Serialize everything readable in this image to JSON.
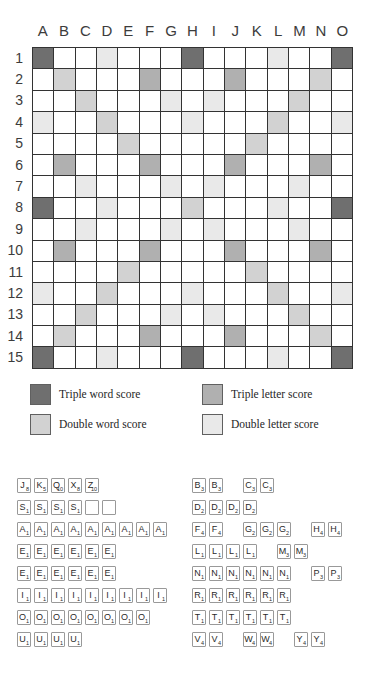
{
  "board": {
    "columns": [
      "A",
      "B",
      "C",
      "D",
      "E",
      "F",
      "G",
      "H",
      "I",
      "J",
      "K",
      "L",
      "M",
      "N",
      "O"
    ],
    "rows": [
      "1",
      "2",
      "3",
      "4",
      "5",
      "6",
      "7",
      "8",
      "9",
      "10",
      "11",
      "12",
      "13",
      "14",
      "15"
    ],
    "premium_squares": {
      "triple_word": [
        "A1",
        "H1",
        "O1",
        "A8",
        "O8",
        "A15",
        "H15",
        "O15"
      ],
      "double_word": [
        "B2",
        "N2",
        "C3",
        "M3",
        "D4",
        "L4",
        "E5",
        "K5",
        "H8",
        "E11",
        "K11",
        "D12",
        "L12",
        "C13",
        "M13",
        "B14",
        "N14"
      ],
      "triple_letter": [
        "F2",
        "J2",
        "B6",
        "F6",
        "J6",
        "N6",
        "B10",
        "F10",
        "J10",
        "N10",
        "F14",
        "J14"
      ],
      "double_letter": [
        "D1",
        "L1",
        "G3",
        "I3",
        "A4",
        "H4",
        "O4",
        "C7",
        "G7",
        "I7",
        "M7",
        "D8",
        "L8",
        "C9",
        "G9",
        "I9",
        "M9",
        "A12",
        "H12",
        "O12",
        "G13",
        "I13",
        "D15",
        "L15"
      ]
    }
  },
  "colors": {
    "triple_word": "#6f6f6f",
    "triple_letter": "#b0b0b0",
    "double_word": "#d2d2d2",
    "double_letter": "#e9e9e9",
    "grid_line": "#333333",
    "tile_border": "#999999"
  },
  "legend": {
    "items": [
      {
        "type": "triple_word",
        "label": "Triple word score"
      },
      {
        "type": "triple_letter",
        "label": "Triple letter score"
      },
      {
        "type": "double_word",
        "label": "Double word score"
      },
      {
        "type": "double_letter",
        "label": "Double letter score"
      }
    ]
  },
  "tile_distribution": {
    "left_rows": [
      [
        {
          "letter": "J",
          "value": 8
        },
        {
          "letter": "K",
          "value": 5
        },
        {
          "letter": "Q",
          "value": 10
        },
        {
          "letter": "X",
          "value": 8
        },
        {
          "letter": "Z",
          "value": 10
        }
      ],
      [
        {
          "letter": "S",
          "value": 1
        },
        {
          "letter": "S",
          "value": 1
        },
        {
          "letter": "S",
          "value": 1
        },
        {
          "letter": "S",
          "value": 1
        },
        {
          "blank": true
        },
        {
          "blank": true
        }
      ],
      [
        {
          "letter": "A",
          "value": 1
        },
        {
          "letter": "A",
          "value": 1
        },
        {
          "letter": "A",
          "value": 1
        },
        {
          "letter": "A",
          "value": 1
        },
        {
          "letter": "A",
          "value": 1
        },
        {
          "letter": "A",
          "value": 1
        },
        {
          "letter": "A",
          "value": 1
        },
        {
          "letter": "A",
          "value": 1
        },
        {
          "letter": "A",
          "value": 1
        }
      ],
      [
        {
          "letter": "E",
          "value": 1
        },
        {
          "letter": "E",
          "value": 1
        },
        {
          "letter": "E",
          "value": 1
        },
        {
          "letter": "E",
          "value": 1
        },
        {
          "letter": "E",
          "value": 1
        },
        {
          "letter": "E",
          "value": 1
        }
      ],
      [
        {
          "letter": "E",
          "value": 1
        },
        {
          "letter": "E",
          "value": 1
        },
        {
          "letter": "E",
          "value": 1
        },
        {
          "letter": "E",
          "value": 1
        },
        {
          "letter": "E",
          "value": 1
        },
        {
          "letter": "E",
          "value": 1
        }
      ],
      [
        {
          "letter": "I",
          "value": 1
        },
        {
          "letter": "I",
          "value": 1
        },
        {
          "letter": "I",
          "value": 1
        },
        {
          "letter": "I",
          "value": 1
        },
        {
          "letter": "I",
          "value": 1
        },
        {
          "letter": "I",
          "value": 1
        },
        {
          "letter": "I",
          "value": 1
        },
        {
          "letter": "I",
          "value": 1
        },
        {
          "letter": "I",
          "value": 1
        }
      ],
      [
        {
          "letter": "O",
          "value": 1
        },
        {
          "letter": "O",
          "value": 1
        },
        {
          "letter": "O",
          "value": 1
        },
        {
          "letter": "O",
          "value": 1
        },
        {
          "letter": "O",
          "value": 1
        },
        {
          "letter": "O",
          "value": 1
        },
        {
          "letter": "O",
          "value": 1
        },
        {
          "letter": "O",
          "value": 1
        }
      ],
      [
        {
          "letter": "U",
          "value": 1
        },
        {
          "letter": "U",
          "value": 1
        },
        {
          "letter": "U",
          "value": 1
        },
        {
          "letter": "U",
          "value": 1
        }
      ]
    ],
    "right_rows": [
      [
        {
          "letter": "B",
          "value": 3
        },
        {
          "letter": "B",
          "value": 3
        },
        null,
        {
          "letter": "C",
          "value": 3
        },
        {
          "letter": "C",
          "value": 3
        }
      ],
      [
        {
          "letter": "D",
          "value": 2
        },
        {
          "letter": "D",
          "value": 2
        },
        {
          "letter": "D",
          "value": 2
        },
        {
          "letter": "D",
          "value": 2
        }
      ],
      [
        {
          "letter": "F",
          "value": 4
        },
        {
          "letter": "F",
          "value": 4
        },
        null,
        {
          "letter": "G",
          "value": 2
        },
        {
          "letter": "G",
          "value": 2
        },
        {
          "letter": "G",
          "value": 2
        },
        null,
        {
          "letter": "H",
          "value": 4
        },
        {
          "letter": "H",
          "value": 4
        }
      ],
      [
        {
          "letter": "L",
          "value": 1
        },
        {
          "letter": "L",
          "value": 1
        },
        {
          "letter": "L",
          "value": 1
        },
        {
          "letter": "L",
          "value": 1
        },
        null,
        {
          "letter": "M",
          "value": 3
        },
        {
          "letter": "M",
          "value": 3
        }
      ],
      [
        {
          "letter": "N",
          "value": 1
        },
        {
          "letter": "N",
          "value": 1
        },
        {
          "letter": "N",
          "value": 1
        },
        {
          "letter": "N",
          "value": 1
        },
        {
          "letter": "N",
          "value": 1
        },
        {
          "letter": "N",
          "value": 1
        },
        null,
        {
          "letter": "P",
          "value": 3
        },
        {
          "letter": "P",
          "value": 3
        }
      ],
      [
        {
          "letter": "R",
          "value": 1
        },
        {
          "letter": "R",
          "value": 1
        },
        {
          "letter": "R",
          "value": 1
        },
        {
          "letter": "R",
          "value": 1
        },
        {
          "letter": "R",
          "value": 1
        },
        {
          "letter": "R",
          "value": 1
        }
      ],
      [
        {
          "letter": "T",
          "value": 1
        },
        {
          "letter": "T",
          "value": 1
        },
        {
          "letter": "T",
          "value": 1
        },
        {
          "letter": "T",
          "value": 1
        },
        {
          "letter": "T",
          "value": 1
        },
        {
          "letter": "T",
          "value": 1
        }
      ],
      [
        {
          "letter": "V",
          "value": 4
        },
        {
          "letter": "V",
          "value": 4
        },
        null,
        {
          "letter": "W",
          "value": 4
        },
        {
          "letter": "W",
          "value": 4
        },
        null,
        {
          "letter": "Y",
          "value": 4
        },
        {
          "letter": "Y",
          "value": 4
        }
      ]
    ]
  }
}
